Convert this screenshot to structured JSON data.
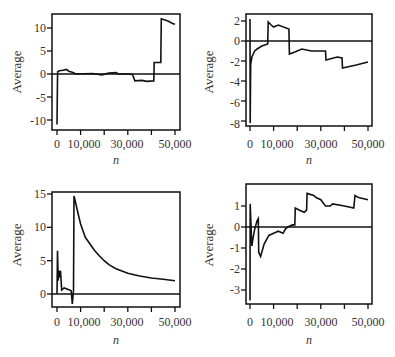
{
  "chart_data": [
    {
      "type": "line",
      "panel": "top-left",
      "title": "",
      "xlabel": "n",
      "ylabel": "Average",
      "xlim": [
        0,
        50000
      ],
      "ylim": [
        -11,
        13
      ],
      "xticks": [
        0,
        10000,
        20000,
        30000,
        40000,
        50000
      ],
      "xtick_labels": [
        "0",
        "10,000",
        "",
        "30,000",
        "",
        "50,000"
      ],
      "yticks": [
        -10,
        -5,
        0,
        5,
        10
      ],
      "ytick_labels": [
        "-10",
        "-5",
        "0",
        "5",
        "10"
      ],
      "reference_line_y": 0,
      "grid": false,
      "x": [
        0,
        200,
        300,
        1000,
        2500,
        4000,
        5000,
        6500,
        8000,
        15000,
        19000,
        22000,
        25000,
        26000,
        30000,
        32000,
        33000,
        36000,
        38000,
        41000,
        41200,
        43000,
        44000,
        44200,
        47000,
        49000,
        50000
      ],
      "values": [
        -11,
        -1,
        0.5,
        0.7,
        0.8,
        1.0,
        0.6,
        0.4,
        0.0,
        0.1,
        -0.2,
        0.2,
        0.3,
        0.0,
        0.0,
        -0.1,
        -1.5,
        -1.4,
        -1.6,
        -1.5,
        2.5,
        2.5,
        2.5,
        12,
        11.5,
        11,
        10.8
      ]
    },
    {
      "type": "line",
      "panel": "top-right",
      "title": "",
      "xlabel": "n",
      "ylabel": "Average",
      "xlim": [
        0,
        50000
      ],
      "ylim": [
        -8.5,
        2.5
      ],
      "xticks": [
        0,
        10000,
        20000,
        30000,
        40000,
        50000
      ],
      "xtick_labels": [
        "0",
        "10,000",
        "",
        "30,000",
        "",
        "50,000"
      ],
      "yticks": [
        -8,
        -6,
        -4,
        -2,
        0,
        2
      ],
      "ytick_labels": [
        "-8",
        "-6",
        "-4",
        "-2",
        "0",
        "2"
      ],
      "reference_line_y": 0,
      "grid": false,
      "x": [
        0,
        100,
        200,
        300,
        500,
        800,
        1200,
        2000,
        3000,
        5000,
        7500,
        7700,
        9000,
        10000,
        12000,
        16500,
        16700,
        19000,
        22000,
        26000,
        29000,
        32000,
        32200,
        37000,
        39000,
        39200,
        45000,
        50000
      ],
      "values": [
        2.2,
        -8.2,
        -4.3,
        -2.3,
        -2.0,
        -1.6,
        -1.4,
        -1.0,
        -0.8,
        -0.5,
        -0.3,
        1.9,
        1.6,
        1.4,
        1.6,
        1.2,
        -1.3,
        -1.1,
        -0.8,
        -1.0,
        -1.0,
        -1.0,
        -1.9,
        -1.6,
        -1.7,
        -2.7,
        -2.4,
        -2.1
      ]
    },
    {
      "type": "line",
      "panel": "bottom-left",
      "title": "",
      "xlabel": "n",
      "ylabel": "Average",
      "xlim": [
        0,
        50000
      ],
      "ylim": [
        -2,
        15
      ],
      "xticks": [
        0,
        10000,
        20000,
        30000,
        40000,
        50000
      ],
      "xtick_labels": [
        "0",
        "10,000",
        "",
        "30,000",
        "",
        "50,000"
      ],
      "yticks": [
        0,
        5,
        10,
        15
      ],
      "ytick_labels": [
        "0",
        "5",
        "10",
        "15"
      ],
      "reference_line_y": 0,
      "grid": false,
      "x": [
        0,
        200,
        500,
        800,
        1200,
        1500,
        2000,
        3000,
        4500,
        6000,
        6500,
        7000,
        7200,
        7500,
        8000,
        9000,
        10000,
        12000,
        13000,
        14000,
        16000,
        18000,
        20000,
        22000,
        25000,
        30000,
        35000,
        40000,
        45000,
        50000
      ],
      "values": [
        0,
        6.5,
        2.0,
        3.5,
        2.5,
        3.5,
        0.6,
        0.9,
        0.7,
        0.5,
        -1.5,
        0.5,
        14.7,
        14.3,
        13.5,
        12,
        10.5,
        8.5,
        8.0,
        7.5,
        6.5,
        5.7,
        5.0,
        4.4,
        3.8,
        3.1,
        2.7,
        2.4,
        2.2,
        2.0
      ]
    },
    {
      "type": "line",
      "panel": "bottom-right",
      "title": "",
      "xlabel": "n",
      "ylabel": "Average",
      "xlim": [
        0,
        50000
      ],
      "ylim": [
        -3.5,
        1.8
      ],
      "xticks": [
        0,
        10000,
        20000,
        30000,
        40000,
        50000
      ],
      "xtick_labels": [
        "0",
        "10,000",
        "",
        "30,000",
        "",
        "50,000"
      ],
      "yticks": [
        -3,
        -2,
        -1,
        0,
        1
      ],
      "ytick_labels": [
        "-3",
        "-2",
        "-1",
        "0",
        "1"
      ],
      "reference_line_y": 0,
      "grid": false,
      "x": [
        0,
        100,
        300,
        500,
        800,
        1200,
        2000,
        3000,
        3500,
        3700,
        4500,
        6000,
        8000,
        10000,
        12000,
        14000,
        15000,
        16000,
        18000,
        19000,
        19200,
        21000,
        23000,
        24000,
        24200,
        27000,
        28000,
        30000,
        32000,
        34000,
        35000,
        40000,
        44000,
        44500,
        46000,
        50000
      ],
      "values": [
        -3.5,
        1.1,
        0.5,
        -0.2,
        -0.9,
        -0.6,
        -0.1,
        0.3,
        0.4,
        -1.2,
        -1.4,
        -0.8,
        -0.4,
        -0.3,
        -0.2,
        -0.3,
        -0.1,
        0.0,
        0.1,
        0.1,
        0.9,
        0.8,
        0.7,
        0.8,
        1.6,
        1.5,
        1.4,
        1.3,
        1.0,
        1.0,
        1.1,
        1.0,
        0.9,
        1.5,
        1.4,
        1.3
      ]
    }
  ],
  "panels": [
    {
      "ylabel": "Average",
      "xlabel": "n",
      "xtick_labels": [
        "0",
        "10,000",
        "30,000",
        "50,000"
      ],
      "ytick_labels": [
        "10",
        "5",
        "0",
        "-5",
        "-10"
      ]
    },
    {
      "ylabel": "Average",
      "xlabel": "n",
      "xtick_labels": [
        "0",
        "10,000",
        "30,000",
        "50,000"
      ],
      "ytick_labels": [
        "2",
        "0",
        "-2",
        "-4",
        "-6",
        "-8"
      ]
    },
    {
      "ylabel": "Average",
      "xlabel": "n",
      "xtick_labels": [
        "0",
        "10,000",
        "30,000",
        "50,000"
      ],
      "ytick_labels": [
        "15",
        "10",
        "5",
        "0"
      ]
    },
    {
      "ylabel": "Average",
      "xlabel": "n",
      "xtick_labels": [
        "0",
        "10,000",
        "30,000",
        "50,000"
      ],
      "ytick_labels": [
        "1",
        "0",
        "-1",
        "-2",
        "-3"
      ]
    }
  ]
}
